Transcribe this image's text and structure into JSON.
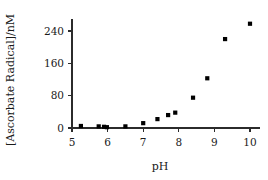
{
  "chart_data": {
    "type": "scatter",
    "title": "",
    "xlabel": "pH",
    "ylabel": "[Ascorbate Radical]/nM",
    "xlim": [
      5,
      10
    ],
    "ylim": [
      0,
      270
    ],
    "xticks": [
      "5",
      "6",
      "7",
      "8",
      "9",
      "10"
    ],
    "xtick_values": [
      5,
      6,
      7,
      8,
      9,
      10
    ],
    "yticks": [
      "0",
      "80",
      "160",
      "240"
    ],
    "ytick_values": [
      0,
      80,
      160,
      240
    ],
    "grid": false,
    "legend": false,
    "marker": "square",
    "marker_color": "#000000",
    "x": [
      5.25,
      5.75,
      5.9,
      5.98,
      6.5,
      7.0,
      7.4,
      7.7,
      7.9,
      8.4,
      8.8,
      9.3,
      10.0
    ],
    "y": [
      5,
      4,
      3,
      2,
      4,
      12,
      22,
      32,
      38,
      75,
      123,
      220,
      258
    ],
    "points": [
      {
        "x": 5.25,
        "y": 5
      },
      {
        "x": 5.75,
        "y": 4
      },
      {
        "x": 5.9,
        "y": 3
      },
      {
        "x": 5.98,
        "y": 2
      },
      {
        "x": 6.5,
        "y": 4
      },
      {
        "x": 7.0,
        "y": 12
      },
      {
        "x": 7.4,
        "y": 22
      },
      {
        "x": 7.7,
        "y": 32
      },
      {
        "x": 7.9,
        "y": 38
      },
      {
        "x": 8.4,
        "y": 75
      },
      {
        "x": 8.8,
        "y": 123
      },
      {
        "x": 9.3,
        "y": 220
      },
      {
        "x": 10.0,
        "y": 258
      }
    ]
  },
  "axes": {
    "x_title": "pH",
    "y_title": "[Ascorbate Radical]/nM"
  }
}
